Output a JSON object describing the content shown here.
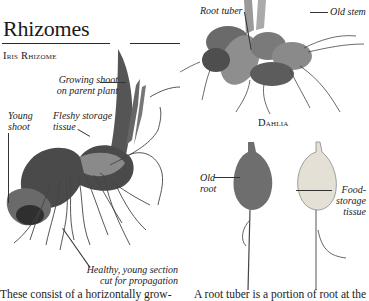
{
  "page": {
    "heading": "Rhizomes",
    "top_stub": "'"
  },
  "iris_figure": {
    "caption": "Iris Rhizome",
    "labels": {
      "growing_shoot_1": "Growing shoot",
      "growing_shoot_2": "on parent plant",
      "young_shoot_1": "Young",
      "young_shoot_2": "shoot",
      "fleshy_1": "Fleshy storage",
      "fleshy_2": "tissue",
      "healthy_1": "Healthy, young section",
      "healthy_2": "cut for propagation"
    }
  },
  "dahlia_figure": {
    "caption": "Dahlia",
    "labels": {
      "root_tuber": "Root tuber",
      "old_stem": "Old stem"
    }
  },
  "root_figure": {
    "labels": {
      "old_root_1": "Old",
      "old_root_2": "root",
      "food_1": "Food-",
      "food_2": "storage",
      "food_3": "tissue"
    }
  },
  "body": {
    "left_column": "These consist of a horizontally grow-",
    "right_column": "A root tuber is a portion of root at the"
  },
  "colors": {
    "text": "#1a1a1a",
    "rule": "#2a2a2a",
    "plant_dark": "#3a3a3a",
    "plant_mid": "#7a7a7a",
    "plant_light": "#c8c8c8",
    "tuber_cut": "#e4e0d6"
  }
}
